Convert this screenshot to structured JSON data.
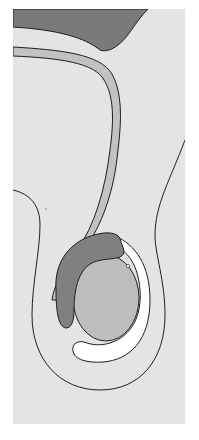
{
  "figure": {
    "type": "anatomical-diagram",
    "colors": {
      "background": "#e4e4e4",
      "dark_structure": "#7a7a7a",
      "cord": "#c2c2c2",
      "testis": "#bdbdbd",
      "epididymis": "#808080",
      "cavity": "#ffffff",
      "outline": "#1e1e1e"
    },
    "caption": ""
  }
}
